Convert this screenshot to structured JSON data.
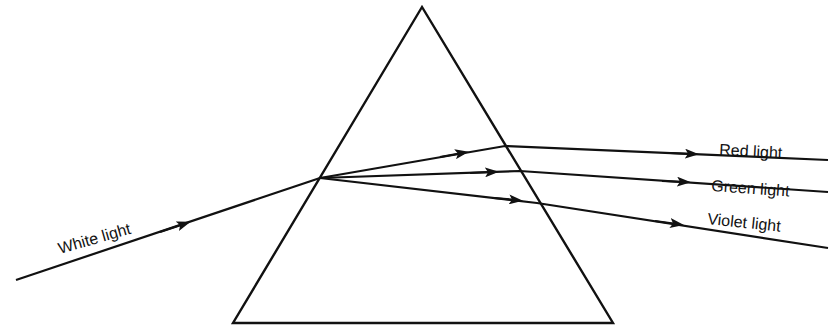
{
  "diagram": {
    "colors": {
      "stroke": "#111111",
      "background": "#ffffff"
    },
    "prism": {
      "apex": [
        422,
        7
      ],
      "base_left": [
        233,
        323
      ],
      "base_right": [
        613,
        323
      ]
    },
    "incident_ray": {
      "label": "White light",
      "from": [
        16,
        280
      ],
      "to": [
        320,
        178
      ]
    },
    "dispersed_rays": [
      {
        "label": "Red light",
        "inside_end": [
          505,
          146
        ],
        "exit_end": [
          828,
          160
        ]
      },
      {
        "label": "Green light",
        "inside_end": [
          520,
          171
        ],
        "exit_end": [
          828,
          192
        ]
      },
      {
        "label": "Violet light",
        "inside_end": [
          537,
          203
        ],
        "exit_end": [
          828,
          222
        ]
      }
    ]
  }
}
